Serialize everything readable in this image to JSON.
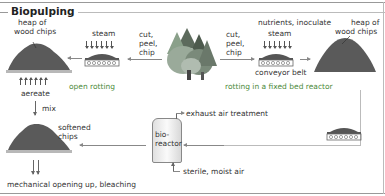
{
  "title": "Biopulping",
  "labels": {
    "heap_left": "heap of\nwood chips",
    "heap_left_1": "heap of",
    "heap_left_2": "wood chips",
    "steam_left": "steam",
    "cut_left_1": "cut,",
    "cut_left_2": "peel,",
    "cut_left_3": "chip",
    "cut_right_1": "cut,",
    "cut_right_2": "peel,",
    "cut_right_3": "chip",
    "nutrients": "nutrients, inoculate",
    "steam_right": "steam",
    "conveyor": "conveyor belt",
    "heap_right_1": "heap of",
    "heap_right_2": "wood chips",
    "aereate": "aereate",
    "open_rotting": "open rotting",
    "fixed_bed": "rotting in a fixed bed reactor",
    "mix": "mix",
    "softened_1": "softened",
    "softened_2": "chips",
    "exhaust": "exhaust air treatment",
    "bioreactor_1": "bio-",
    "bioreactor_2": "reactor",
    "sterile": "sterile, moist air",
    "mechanical": "mechanical opening up, bleaching"
  },
  "colors": {
    "heap": "#5a5a5a",
    "accent_green": "#4c8a3a",
    "tree_dark": "#4d5a4d",
    "tree_light": "#8aa08a"
  },
  "icons": [
    "heap-icon",
    "conveyor-belt-icon",
    "forest-icon",
    "bioreactor-icon"
  ]
}
